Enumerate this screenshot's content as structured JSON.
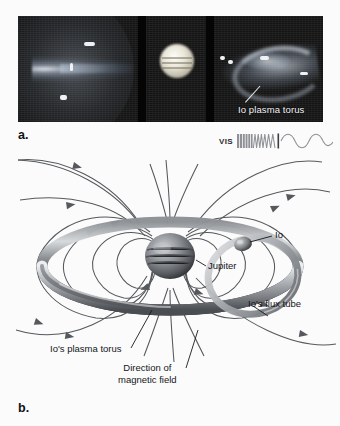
{
  "figure": {
    "panels": [
      {
        "id": "a",
        "letter": "a.",
        "type": "photograph"
      },
      {
        "id": "b",
        "letter": "b.",
        "type": "diagram"
      }
    ]
  },
  "panel_a": {
    "letter": "a.",
    "description": "Three-frame astronomical image sequence of Jupiter",
    "frames": [
      {
        "name": "left-frame",
        "content": "extended emission jet and halo"
      },
      {
        "name": "middle-frame",
        "content": "bright Jupiter disk with cloud bands"
      },
      {
        "name": "right-frame",
        "content": "Io plasma torus arc"
      }
    ],
    "callout": {
      "label": "Io plasma torus"
    },
    "spectrum": {
      "band_label": "VIS",
      "band_name": "visible light"
    }
  },
  "panel_b": {
    "letter": "b.",
    "title": "Jupiter magnetosphere, Io plasma torus and Io's flux tube",
    "labels": {
      "jupiter": "Jupiter",
      "io": "Io",
      "flux_tube": "Io's flux tube",
      "plasma_torus": "Io's plasma torus",
      "field_direction_line1": "Direction of",
      "field_direction_line2": "magnetic field"
    }
  },
  "colors": {
    "background": "#fbfbfb",
    "photo_background": "#0a0a0a",
    "photo_label_text": "#f2f4f7",
    "diagram_line": "#55585c",
    "torus_dark": "#3a3d42",
    "torus_light": "#cdd0d4",
    "text": "#14161a"
  }
}
